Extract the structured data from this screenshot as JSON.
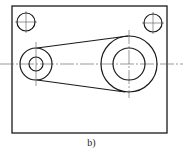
{
  "figure": {
    "caption": "b)",
    "frame": {
      "x": 12,
      "y": 6,
      "width": 155,
      "height": 127
    },
    "small_holes": [
      {
        "cx": 26,
        "cy": 22,
        "r": 9
      },
      {
        "cx": 153,
        "cy": 23,
        "r": 9
      }
    ],
    "left_boss": {
      "cx": 36,
      "cy": 64,
      "r_outer": 16,
      "r_inner": 7
    },
    "right_boss": {
      "cx": 129,
      "cy": 64,
      "r_outer": 28,
      "r_inner": 16
    },
    "centerline_y": 64,
    "colors": {
      "line": "#1a1a1a",
      "centerline": "#555555"
    }
  }
}
